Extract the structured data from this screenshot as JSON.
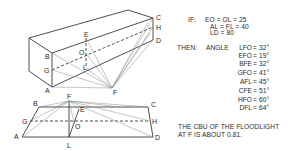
{
  "diagram": {
    "perspective_view": {
      "labels": {
        "A": "A",
        "B": "B",
        "C": "C",
        "D": "D",
        "E": "E",
        "F": "F",
        "G": "G",
        "H": "H",
        "L": "L",
        "O": "O"
      }
    },
    "plan_view": {
      "labels": {
        "A": "A",
        "B": "B",
        "C": "C",
        "D": "D",
        "E": "E",
        "F": "F",
        "G": "G",
        "H": "H",
        "L": "L",
        "O": "O"
      }
    }
  },
  "given": {
    "label": "IF:",
    "lines": [
      "EO = OL = 25",
      "AL = FL = 40",
      "LD = 80"
    ]
  },
  "result": {
    "label": "THEN:",
    "prefix": "ANGLE",
    "angles": [
      {
        "name": "LFO",
        "value": "= 32°"
      },
      {
        "name": "EFO",
        "value": "= 19°"
      },
      {
        "name": "BFE",
        "value": "= 32°"
      },
      {
        "name": "GFO",
        "value": "= 41°"
      },
      {
        "name": "AFL",
        "value": "= 45°"
      },
      {
        "name": "CFE",
        "value": "= 51°"
      },
      {
        "name": "HFO",
        "value": "= 60°"
      },
      {
        "name": "DFL",
        "value": "= 64°"
      }
    ]
  },
  "conclusion": {
    "lines": [
      "THE CBU OF THE FLOODLIGHT",
      "AT F IS ABOUT 0.81."
    ]
  }
}
